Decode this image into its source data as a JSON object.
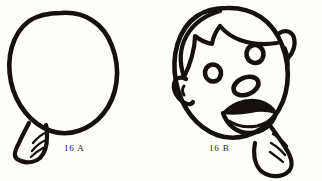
{
  "page": {
    "background_color": "#fdfdfb",
    "ink_color": "#16110f",
    "width": 322,
    "height": 181
  },
  "figures": [
    {
      "id": "16A",
      "caption": "16 A",
      "subject": "balloon",
      "description": "Uninflated-outline balloon: a large tilted oval with a small ribbed neck nozzle at the lower left",
      "parts": [
        {
          "name": "balloon-body",
          "shape": "tilted-oval-outline"
        },
        {
          "name": "balloon-neck",
          "shape": "ribbed-cuff"
        },
        {
          "name": "balloon-neck-ribs",
          "count": 3
        }
      ]
    },
    {
      "id": "16B",
      "caption": "16 B",
      "subject": "face",
      "description": "Cartoon child's head drawn over the same oval: hair with pointed fringe, two ring eyes, an oval nose, an open smiling mouth with filled upper lip, one ear, and a ribbed collar at the lower right",
      "parts": [
        {
          "name": "head-outline",
          "shape": "tilted-oval-outline"
        },
        {
          "name": "hair",
          "shape": "cap-with-pointed-fringe"
        },
        {
          "name": "eye-left",
          "shape": "ring"
        },
        {
          "name": "eye-right",
          "shape": "ring"
        },
        {
          "name": "nose",
          "shape": "oval-ring"
        },
        {
          "name": "mouth",
          "shape": "open-smile-filled-lip"
        },
        {
          "name": "ear",
          "shape": "hook"
        },
        {
          "name": "collar",
          "shape": "ribbed-cuff"
        },
        {
          "name": "collar-ribs",
          "count": 3
        }
      ]
    }
  ]
}
